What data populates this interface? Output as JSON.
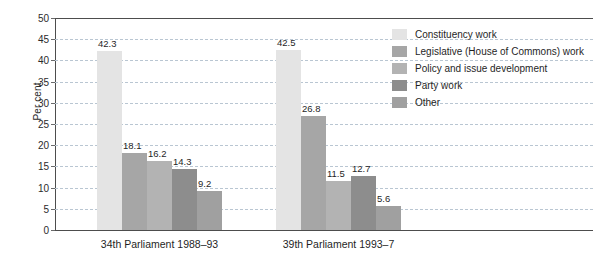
{
  "chart_data": {
    "type": "bar",
    "title": "",
    "xlabel": "",
    "ylabel": "Per cent",
    "ylim": [
      0,
      50
    ],
    "ytick_step": 5,
    "yticks": [
      50,
      45,
      40,
      35,
      30,
      25,
      20,
      15,
      10,
      5,
      0
    ],
    "grid": true,
    "legend_position": "right",
    "categories": [
      "34th Parliament 1988–93",
      "39th Parliament 1993–7"
    ],
    "series": [
      {
        "name": "Constituency work",
        "color": "#e4e4e4",
        "values": [
          42.3,
          42.5
        ]
      },
      {
        "name": "Legislative (House of Commons) work",
        "color": "#a6a6a6",
        "values": [
          18.1,
          26.8
        ]
      },
      {
        "name": "Policy and issue development",
        "color": "#b3b3b3",
        "values": [
          16.2,
          11.5
        ]
      },
      {
        "name": "Party work",
        "color": "#8d8d8d",
        "values": [
          14.3,
          12.7
        ]
      },
      {
        "name": "Other",
        "color": "#a0a0a0",
        "values": [
          9.2,
          5.6
        ]
      }
    ],
    "value_labels": [
      [
        "42.3",
        "18.1",
        "16.2",
        "14.3",
        "9.2"
      ],
      [
        "42.5",
        "26.8",
        "11.5",
        "12.7",
        "5.6"
      ]
    ]
  },
  "axis": {
    "y_title": "Per cent",
    "tick_0": "0",
    "tick_5": "5",
    "tick_10": "10",
    "tick_15": "15",
    "tick_20": "20",
    "tick_25": "25",
    "tick_30": "30",
    "tick_35": "35",
    "tick_40": "40",
    "tick_45": "45",
    "tick_50": "50"
  },
  "legend": {
    "items": [
      {
        "label": "Constituency work",
        "color": "#e4e4e4"
      },
      {
        "label": "Legislative (House of Commons) work",
        "color": "#a6a6a6"
      },
      {
        "label": "Policy and issue development",
        "color": "#b3b3b3"
      },
      {
        "label": "Party work",
        "color": "#8d8d8d"
      },
      {
        "label": "Other",
        "color": "#a0a0a0"
      }
    ]
  }
}
